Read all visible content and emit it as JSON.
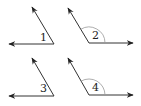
{
  "diagram": {
    "type": "angles",
    "stroke_color": "#333333",
    "arc_color": "#999999",
    "angles": [
      {
        "label": "1",
        "vertex": [
          54,
          44
        ],
        "ray_a": [
          9,
          44
        ],
        "ray_b": [
          32,
          7
        ],
        "arc": false,
        "label_pos": [
          40,
          41
        ]
      },
      {
        "label": "2",
        "vertex": [
          89,
          43
        ],
        "ray_a": [
          133,
          43
        ],
        "ray_b": [
          68,
          8
        ],
        "arc": true,
        "arc_radius": 16,
        "label_pos": [
          92,
          39
        ]
      },
      {
        "label": "3",
        "vertex": [
          54,
          96
        ],
        "ray_a": [
          9,
          96
        ],
        "ray_b": [
          32,
          58
        ],
        "arc": false,
        "label_pos": [
          40,
          92
        ]
      },
      {
        "label": "4",
        "vertex": [
          89,
          95
        ],
        "ray_a": [
          133,
          95
        ],
        "ray_b": [
          68,
          58
        ],
        "arc": true,
        "arc_radius": 16,
        "label_pos": [
          92,
          91
        ]
      }
    ]
  }
}
